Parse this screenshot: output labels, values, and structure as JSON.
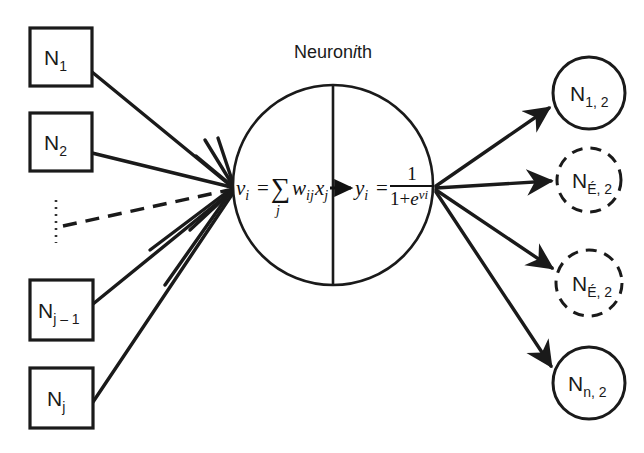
{
  "figure": {
    "title_prefix": "Neuron",
    "title_italic": "i",
    "title_suffix": "th",
    "background_color": "#ffffff",
    "ink_color": "#1a1a1a"
  },
  "inputs": {
    "nodes": [
      {
        "base": "N",
        "sub": "1",
        "x": 30,
        "y": 28,
        "w": 62,
        "h": 58
      },
      {
        "base": "N",
        "sub": "2",
        "x": 30,
        "y": 113,
        "w": 62,
        "h": 58
      },
      {
        "base": "N",
        "sub": "j – 1",
        "x": 30,
        "y": 280,
        "w": 63,
        "h": 60
      },
      {
        "base": "N",
        "sub": "j",
        "x": 30,
        "y": 368,
        "w": 63,
        "h": 60
      }
    ],
    "ellipsis": {
      "x": 56,
      "y_top": 200,
      "y_bottom": 243,
      "style": "vertical-dotted"
    },
    "dashed_edge_label": "skipped-inputs"
  },
  "neuron": {
    "center_x": 333,
    "center_y": 185,
    "radius": 100,
    "divider_x": 333,
    "sum_point": {
      "x": 233,
      "y": 188
    },
    "fan_point": {
      "x": 434,
      "y": 188
    },
    "left_formula": {
      "lhs": "v",
      "lhs_sub": "i",
      "equals": "=",
      "sigma": "∑",
      "sigma_sub": "j",
      "w": "w",
      "w_sub": "ij",
      "x": "x",
      "x_sub": "j",
      "plain": "v_i = ∑_j w_ij x_j"
    },
    "right_formula": {
      "lhs": "y",
      "lhs_sub": "i",
      "equals": "=",
      "numerator": "1",
      "denom_one": "1",
      "denom_plus": "+",
      "denom_e": "e",
      "denom_exp": "vi",
      "plain": "y_i = 1 / (1 + e^vi)"
    }
  },
  "outputs": {
    "nodes": [
      {
        "base": "N",
        "sub": "1, 2",
        "cx": 589,
        "cy": 93,
        "r": 36,
        "dashed": false
      },
      {
        "base": "N",
        "sub": "É, 2",
        "cx": 589,
        "cy": 180,
        "r": 32,
        "dashed": true
      },
      {
        "base": "N",
        "sub": "É, 2",
        "cx": 589,
        "cy": 283,
        "r": 33,
        "dashed": true
      },
      {
        "base": "N",
        "sub": "n, 2",
        "cx": 589,
        "cy": 383,
        "r": 36,
        "dashed": false
      }
    ]
  }
}
